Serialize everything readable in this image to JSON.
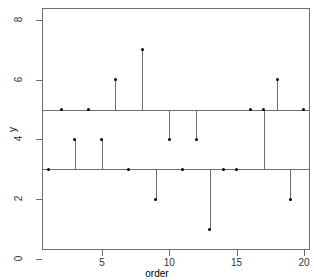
{
  "chart_data": {
    "type": "scatter",
    "title": "",
    "xlabel": "order",
    "ylabel": "y",
    "x": [
      1,
      2,
      3,
      4,
      5,
      6,
      7,
      8,
      9,
      10,
      11,
      12,
      13,
      14,
      15,
      16,
      17,
      18,
      19,
      20
    ],
    "values": [
      3,
      5,
      4,
      5,
      4,
      6,
      3,
      7,
      2,
      4,
      3,
      4,
      1,
      3,
      3,
      5,
      5,
      6,
      2,
      5
    ],
    "xlim": [
      0.55,
      20.45
    ],
    "ylim": [
      0.3,
      8.4
    ],
    "xticks": [
      5,
      10,
      15,
      20
    ],
    "xtick_labels": [
      "5",
      "10",
      "15",
      "20"
    ],
    "yticks": [
      0,
      2,
      4,
      6,
      8
    ],
    "ytick_labels": [
      "0",
      "2",
      "4",
      "6",
      "8"
    ],
    "grid": false,
    "legend": null,
    "reference_lines": [
      {
        "y": 3,
        "label": "lower reference line"
      },
      {
        "y": 5,
        "label": "upper reference line"
      }
    ],
    "stems": {
      "note": "each point is connected by a vertical line to its nearest reference line (3 or 5)",
      "baselines": [
        3,
        5,
        3,
        5,
        3,
        5,
        3,
        5,
        3,
        5,
        3,
        5,
        3,
        3,
        3,
        5,
        3,
        5,
        3,
        5
      ]
    },
    "colors": {
      "point": "#000000",
      "line": "#6e6e6e",
      "axis": "#6e6e6e",
      "background": "#ffffff",
      "tick_label": "#333333"
    },
    "point_labels": [
      {
        "x": 1,
        "y": 3
      },
      {
        "x": 2,
        "y": 5
      },
      {
        "x": 3,
        "y": 4
      },
      {
        "x": 4,
        "y": 5
      },
      {
        "x": 5,
        "y": 4
      },
      {
        "x": 6,
        "y": 6
      },
      {
        "x": 7,
        "y": 3
      },
      {
        "x": 8,
        "y": 7
      },
      {
        "x": 9,
        "y": 2
      },
      {
        "x": 10,
        "y": 4
      },
      {
        "x": 11,
        "y": 3
      },
      {
        "x": 12,
        "y": 4
      },
      {
        "x": 13,
        "y": 1
      },
      {
        "x": 14,
        "y": 3
      },
      {
        "x": 15,
        "y": 3
      },
      {
        "x": 16,
        "y": 5
      },
      {
        "x": 17,
        "y": 5
      },
      {
        "x": 18,
        "y": 6
      },
      {
        "x": 19,
        "y": 2
      },
      {
        "x": 20,
        "y": 5
      }
    ]
  }
}
